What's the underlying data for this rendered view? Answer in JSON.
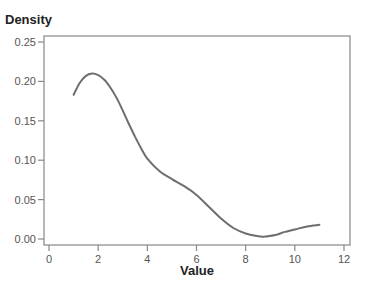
{
  "chart_data": {
    "type": "line",
    "title": "",
    "xlabel": "Value",
    "ylabel": "Density",
    "xlim": [
      -0.2,
      12.25
    ],
    "ylim": [
      -0.008,
      0.258
    ],
    "x_ticks": [
      0,
      2,
      4,
      6,
      8,
      10,
      12
    ],
    "x_tick_labels": [
      "0",
      "2",
      "4",
      "6",
      "8",
      "10",
      "12"
    ],
    "y_ticks": [
      0.0,
      0.05,
      0.1,
      0.15,
      0.2,
      0.25
    ],
    "y_tick_labels": [
      "0.00",
      "0.05",
      "0.10",
      "0.15",
      "0.20",
      "0.25"
    ],
    "grid": false,
    "legend": null,
    "series": [
      {
        "name": "density",
        "color": "#6e6e6e",
        "x": [
          1.0,
          1.25,
          1.5,
          1.75,
          2.0,
          2.25,
          2.5,
          2.75,
          3.0,
          3.25,
          3.5,
          3.75,
          4.0,
          4.5,
          5.0,
          5.5,
          6.0,
          6.5,
          7.0,
          7.5,
          8.0,
          8.4,
          8.8,
          9.2,
          9.6,
          10.0,
          10.5,
          11.0
        ],
        "values": [
          0.183,
          0.198,
          0.207,
          0.21,
          0.208,
          0.202,
          0.192,
          0.179,
          0.163,
          0.146,
          0.13,
          0.115,
          0.102,
          0.086,
          0.076,
          0.067,
          0.056,
          0.041,
          0.026,
          0.014,
          0.007,
          0.004,
          0.003,
          0.005,
          0.009,
          0.012,
          0.016,
          0.018
        ]
      }
    ]
  },
  "colors": {
    "line": "#6e6e6e",
    "axis": "#888888",
    "background": "#ffffff"
  }
}
